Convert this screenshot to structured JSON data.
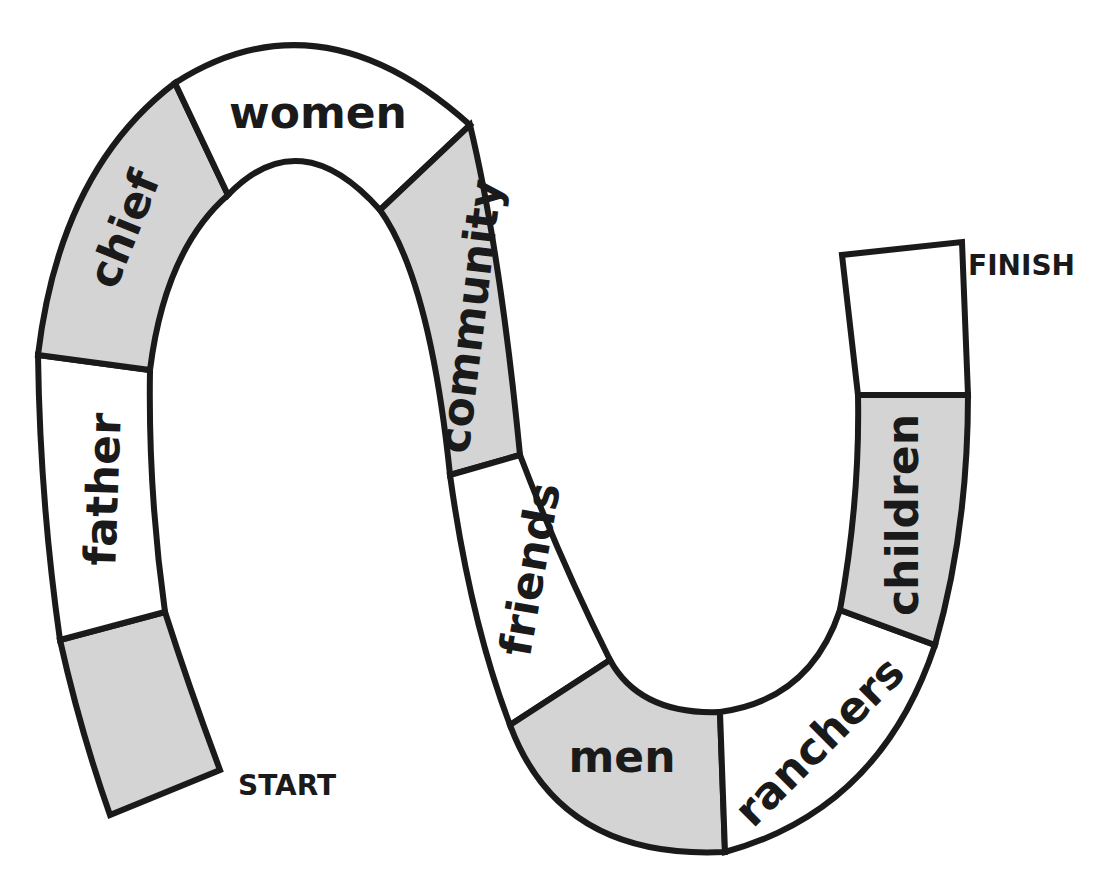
{
  "heading_partial": "",
  "board": {
    "start_label": "START",
    "finish_label": "FINISH",
    "colors": {
      "shaded": "#d4d4d4",
      "blank": "#ffffff",
      "outline": "#1a1a1a"
    },
    "spaces": [
      {
        "index": 0,
        "label": "",
        "shaded": true,
        "role": "start"
      },
      {
        "index": 1,
        "label": "father",
        "shaded": false
      },
      {
        "index": 2,
        "label": "chief",
        "shaded": true
      },
      {
        "index": 3,
        "label": "women",
        "shaded": false
      },
      {
        "index": 4,
        "label": "community",
        "shaded": true
      },
      {
        "index": 5,
        "label": "friends",
        "shaded": false
      },
      {
        "index": 6,
        "label": "men",
        "shaded": true
      },
      {
        "index": 7,
        "label": "ranchers",
        "shaded": false
      },
      {
        "index": 8,
        "label": "children",
        "shaded": true
      },
      {
        "index": 9,
        "label": "",
        "shaded": false,
        "role": "finish"
      }
    ]
  }
}
